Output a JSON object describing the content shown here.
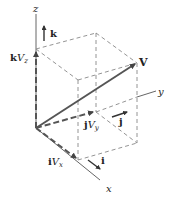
{
  "diagram": {
    "axes": {
      "x_label": "x",
      "y_label": "y",
      "z_label": "z"
    },
    "vector": {
      "label": "V"
    },
    "components": {
      "x": {
        "unit": "i",
        "comp": "V",
        "sub": "x"
      },
      "y": {
        "unit": "j",
        "comp": "V",
        "sub": "y"
      },
      "z": {
        "unit": "k",
        "comp": "V",
        "sub": "z"
      }
    },
    "unit_vectors": {
      "i": "i",
      "j": "j",
      "k": "k"
    },
    "colors": {
      "axis": "#555555",
      "dashed": "#777777",
      "vector": "#555555",
      "text": "#222222"
    }
  }
}
